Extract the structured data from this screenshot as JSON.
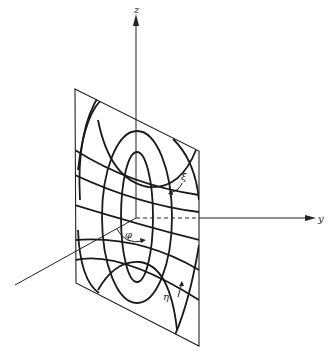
{
  "figure": {
    "axes": {
      "z": {
        "label": "z"
      },
      "y": {
        "label": "y"
      },
      "x": {
        "label": ""
      }
    },
    "labels": {
      "xi": "ξ",
      "eta": "η",
      "phi": "φ"
    },
    "colors": {
      "ink": "#1a1a1a",
      "background": "#ffffff"
    }
  }
}
